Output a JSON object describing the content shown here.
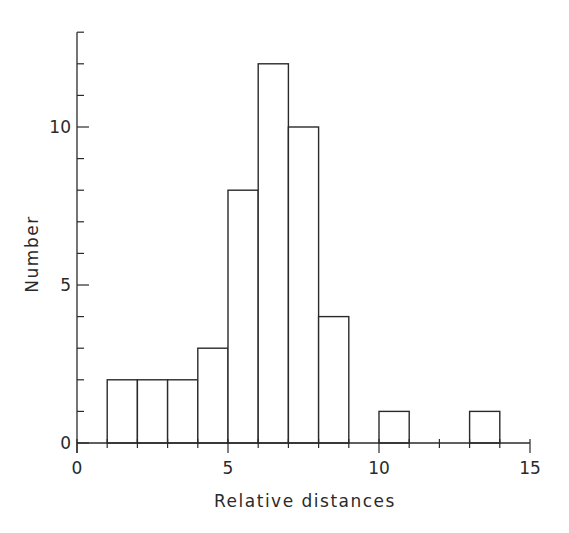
{
  "chart_data": {
    "type": "bar",
    "subtype": "histogram",
    "title": "",
    "xlabel": "Relative distances",
    "ylabel": "Number",
    "xlim": [
      0,
      15
    ],
    "ylim": [
      0,
      13
    ],
    "x_ticks": [
      0,
      5,
      10,
      15
    ],
    "y_ticks": [
      0,
      5,
      10
    ],
    "x_minor_step": 1,
    "y_minor_step": 1,
    "grid": false,
    "legend": null,
    "bins": [
      {
        "x0": 1,
        "x1": 2,
        "value": 2
      },
      {
        "x0": 2,
        "x1": 3,
        "value": 2
      },
      {
        "x0": 3,
        "x1": 4,
        "value": 2
      },
      {
        "x0": 4,
        "x1": 5,
        "value": 3
      },
      {
        "x0": 5,
        "x1": 6,
        "value": 8
      },
      {
        "x0": 6,
        "x1": 7,
        "value": 12
      },
      {
        "x0": 7,
        "x1": 8,
        "value": 10
      },
      {
        "x0": 8,
        "x1": 9,
        "value": 4
      },
      {
        "x0": 10,
        "x1": 11,
        "value": 1
      },
      {
        "x0": 13,
        "x1": 14,
        "value": 1
      }
    ],
    "categories": [
      "1-2",
      "2-3",
      "3-4",
      "4-5",
      "5-6",
      "6-7",
      "7-8",
      "8-9",
      "10-11",
      "13-14"
    ],
    "values": [
      2,
      2,
      2,
      3,
      8,
      12,
      10,
      4,
      1,
      1
    ],
    "line_color": "#2a2a2a",
    "fill_color": "#ffffff"
  }
}
